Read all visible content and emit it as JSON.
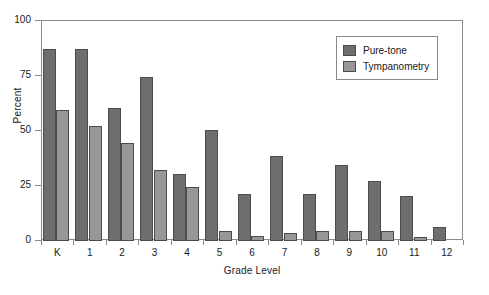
{
  "chart_data": {
    "type": "bar",
    "title": "",
    "xlabel": "Grade Level",
    "ylabel": "Percent",
    "categories": [
      "K",
      "1",
      "2",
      "3",
      "4",
      "5",
      "6",
      "7",
      "8",
      "9",
      "10",
      "11",
      "12"
    ],
    "series": [
      {
        "name": "Pure-tone",
        "color": "#6e6e6e",
        "values": [
          87,
          87,
          60,
          74,
          30,
          50,
          21,
          38,
          21,
          34,
          27,
          20,
          6
        ]
      },
      {
        "name": "Tympanometry",
        "color": "#979797",
        "values": [
          59,
          52,
          44,
          32,
          24,
          4,
          2,
          3,
          4,
          4,
          4,
          1.5,
          null
        ]
      }
    ],
    "ylim": [
      0,
      100
    ],
    "yticks": [
      0,
      25,
      50,
      75,
      100
    ],
    "ytick_labels": [
      "0",
      "25",
      "50",
      "75",
      "100"
    ],
    "grid": false,
    "legend_position": "top-right",
    "legend_entries": [
      "Pure-tone",
      "Tympanometry"
    ]
  }
}
